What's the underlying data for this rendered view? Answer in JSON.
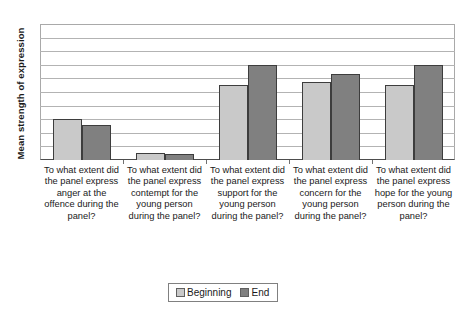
{
  "chart_data": {
    "type": "bar",
    "title": "",
    "subtitle": "",
    "xlabel": "",
    "ylabel": "Mean strength of expression",
    "ylim": [
      0,
      10
    ],
    "y_tick_labels_shown": false,
    "grid": true,
    "gridline_count": 10,
    "legend_position": "bottom-center",
    "categories": [
      "To what extent did the panel express anger at the offence during the panel?",
      "To what extent did the panel express contempt for the young person during the panel?",
      "To what extent did the panel express support for the young person during the panel?",
      "To what extent did the panel express concern for the young person during the panel?",
      "To what extent did the panel express hope for the young person during the panel?"
    ],
    "series": [
      {
        "name": "Beginning",
        "color": "#c9c9c9",
        "values": [
          3.0,
          0.5,
          5.5,
          5.7,
          5.5
        ]
      },
      {
        "name": "End",
        "color": "#808080",
        "values": [
          2.6,
          0.45,
          7.0,
          6.3,
          7.0
        ]
      }
    ]
  },
  "legend": {
    "items": [
      {
        "label": "Beginning",
        "color": "#c9c9c9"
      },
      {
        "label": "End",
        "color": "#808080"
      }
    ]
  },
  "colors": {
    "beginning": "#c9c9c9",
    "end": "#808080",
    "gridline": "#b3b3b3",
    "axis": "#4d4d4d",
    "text": "#1a1a1a"
  }
}
